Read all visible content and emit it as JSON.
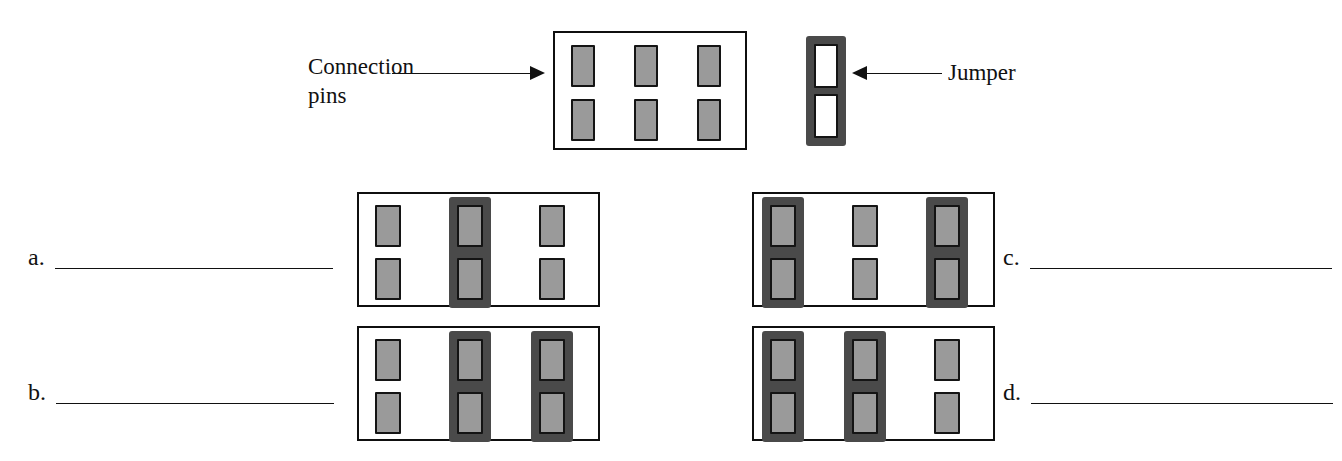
{
  "page": {
    "background": "#ffffff",
    "ink": "#111111",
    "pin_fill": "#9a9a9a",
    "pin_stroke": "#141414",
    "jumper_fill": "#4a4a4a",
    "hole_fill": "#ffffff"
  },
  "legend": {
    "connection_pins_label": "Connection\npins",
    "jumper_label": "Jumper",
    "left_arrow_icon": "arrow-right-icon",
    "right_arrow_icon": "arrow-left-icon"
  },
  "reference_board": {
    "name": "reference-pin-header",
    "rows": 2,
    "columns": 3,
    "jumpers": []
  },
  "standalone_jumper": {
    "name": "standalone-jumper",
    "holes": 2
  },
  "options": [
    {
      "id": "a",
      "label": "a.",
      "board_name": "option-a-pin-header",
      "rows": 2,
      "columns": 3,
      "jumpers": [
        2
      ],
      "answer_value": ""
    },
    {
      "id": "b",
      "label": "b.",
      "board_name": "option-b-pin-header",
      "rows": 2,
      "columns": 3,
      "jumpers": [
        2,
        3
      ],
      "answer_value": ""
    },
    {
      "id": "c",
      "label": "c.",
      "board_name": "option-c-pin-header",
      "rows": 2,
      "columns": 3,
      "jumpers": [
        1,
        3
      ],
      "answer_value": ""
    },
    {
      "id": "d",
      "label": "d.",
      "board_name": "option-d-pin-header",
      "rows": 2,
      "columns": 3,
      "jumpers": [
        1,
        2
      ],
      "answer_value": ""
    }
  ]
}
